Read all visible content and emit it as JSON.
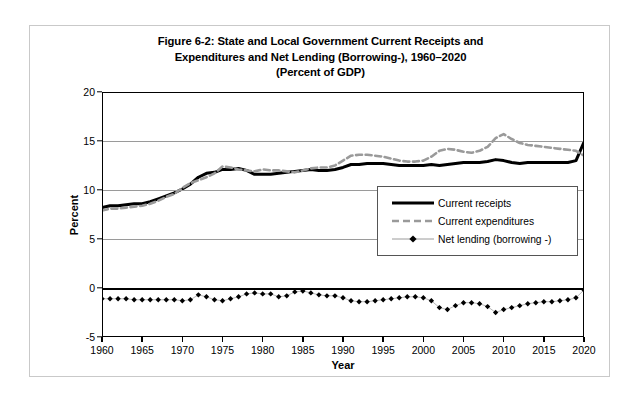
{
  "figure": {
    "title_lines": [
      "Figure 6-2: State and Local Government Current Receipts and",
      "Expenditures and Net Lending (Borrowing-), 1960–2020",
      "(Percent of GDP)"
    ]
  },
  "legend": {
    "items": [
      {
        "label": "Current receipts",
        "key": "solid-black-line",
        "color": "#000000"
      },
      {
        "label": "Current expenditures",
        "key": "dashed-gray-line",
        "color": "#9a9a9a"
      },
      {
        "label": "Net lending (borrowing -)",
        "key": "line-with-diamond-markers",
        "color": "#000000"
      }
    ]
  },
  "chart_data": {
    "type": "line",
    "title": "Figure 6-2: State and Local Government Current Receipts and Expenditures and Net Lending (Borrowing-), 1960–2020 (Percent of GDP)",
    "xlabel": "Year",
    "ylabel": "Percent",
    "xlim": [
      1960,
      2020
    ],
    "ylim": [
      -5,
      20
    ],
    "yticks": [
      -5,
      0,
      5,
      10,
      15,
      20
    ],
    "xticks": [
      1960,
      1965,
      1970,
      1975,
      1980,
      1985,
      1990,
      1995,
      2000,
      2005,
      2010,
      2015,
      2020
    ],
    "grid": true,
    "legend_position": "center-right",
    "x": [
      1960,
      1961,
      1962,
      1963,
      1964,
      1965,
      1966,
      1967,
      1968,
      1969,
      1970,
      1971,
      1972,
      1973,
      1974,
      1975,
      1976,
      1977,
      1978,
      1979,
      1980,
      1981,
      1982,
      1983,
      1984,
      1985,
      1986,
      1987,
      1988,
      1989,
      1990,
      1991,
      1992,
      1993,
      1994,
      1995,
      1996,
      1997,
      1998,
      1999,
      2000,
      2001,
      2002,
      2003,
      2004,
      2005,
      2006,
      2007,
      2008,
      2009,
      2010,
      2011,
      2012,
      2013,
      2014,
      2015,
      2016,
      2017,
      2018,
      2019,
      2020
    ],
    "series": [
      {
        "name": "Current receipts",
        "style": "solid",
        "color": "#000000",
        "values": [
          8.2,
          8.4,
          8.4,
          8.5,
          8.6,
          8.6,
          8.8,
          9.1,
          9.4,
          9.7,
          10.1,
          10.6,
          11.3,
          11.7,
          11.8,
          12.1,
          12.1,
          12.2,
          12.0,
          11.6,
          11.6,
          11.6,
          11.7,
          11.8,
          11.9,
          12.0,
          12.1,
          12.0,
          12.0,
          12.1,
          12.3,
          12.6,
          12.6,
          12.7,
          12.7,
          12.7,
          12.6,
          12.5,
          12.5,
          12.5,
          12.5,
          12.6,
          12.5,
          12.6,
          12.7,
          12.8,
          12.8,
          12.8,
          12.9,
          13.1,
          13.0,
          12.8,
          12.7,
          12.8,
          12.8,
          12.8,
          12.8,
          12.8,
          12.8,
          13.0,
          14.9
        ]
      },
      {
        "name": "Current expenditures",
        "style": "dashed",
        "color": "#9a9a9a",
        "values": [
          7.9,
          8.1,
          8.1,
          8.2,
          8.3,
          8.4,
          8.6,
          8.9,
          9.3,
          9.6,
          10.2,
          10.7,
          11.0,
          11.3,
          11.7,
          12.4,
          12.3,
          12.1,
          12.0,
          11.9,
          12.1,
          12.0,
          12.0,
          11.9,
          11.8,
          12.0,
          12.2,
          12.3,
          12.3,
          12.5,
          13.0,
          13.5,
          13.6,
          13.6,
          13.5,
          13.4,
          13.2,
          13.0,
          12.9,
          12.9,
          13.0,
          13.4,
          14.0,
          14.2,
          14.1,
          13.9,
          13.8,
          14.0,
          14.4,
          15.3,
          15.7,
          15.2,
          14.8,
          14.6,
          14.5,
          14.4,
          14.3,
          14.2,
          14.1,
          14.0,
          13.5
        ]
      },
      {
        "name": "Net lending (borrowing -)",
        "style": "markers",
        "color": "#000000",
        "marker": "diamond",
        "values": [
          -1.1,
          -1.1,
          -1.1,
          -1.1,
          -1.2,
          -1.2,
          -1.2,
          -1.2,
          -1.2,
          -1.2,
          -1.3,
          -1.2,
          -0.7,
          -0.9,
          -1.2,
          -1.3,
          -1.1,
          -0.9,
          -0.6,
          -0.5,
          -0.6,
          -0.6,
          -0.9,
          -0.8,
          -0.4,
          -0.3,
          -0.5,
          -0.7,
          -0.8,
          -0.8,
          -1.0,
          -1.3,
          -1.4,
          -1.4,
          -1.3,
          -1.2,
          -1.1,
          -1.0,
          -0.9,
          -0.9,
          -1.0,
          -1.3,
          -2.0,
          -2.2,
          -1.8,
          -1.5,
          -1.5,
          -1.6,
          -1.9,
          -2.5,
          -2.2,
          -2.0,
          -1.8,
          -1.6,
          -1.5,
          -1.4,
          -1.4,
          -1.3,
          -1.2,
          -1.0,
          -0.2
        ]
      }
    ]
  }
}
